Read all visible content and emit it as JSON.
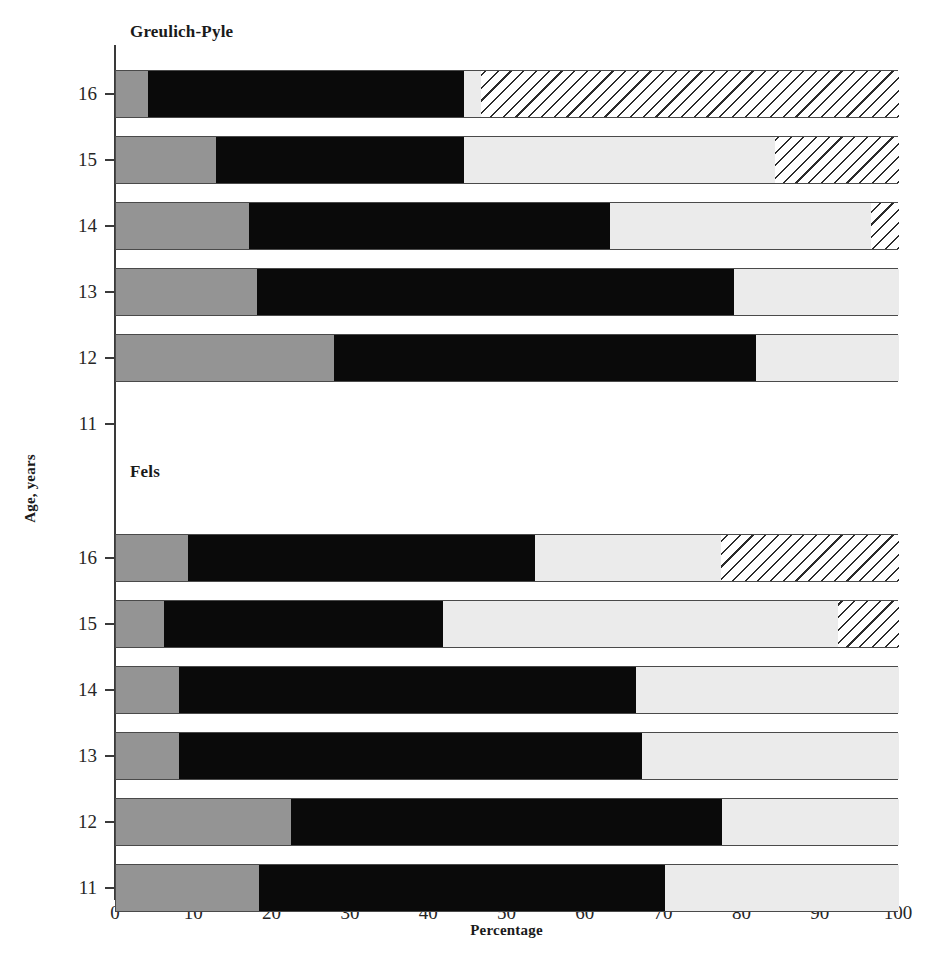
{
  "chart_data": {
    "type": "bar",
    "orientation": "horizontal",
    "stacked": true,
    "title": "",
    "xlabel": "Percentage",
    "ylabel": "Age, years",
    "xlim": [
      0,
      100
    ],
    "xticks": [
      0,
      10,
      20,
      30,
      40,
      50,
      60,
      70,
      80,
      90,
      100
    ],
    "grid": false,
    "legend": "none",
    "series": [
      {
        "name": "segment-1",
        "style": "solid-gray",
        "color": "#949494"
      },
      {
        "name": "segment-2",
        "style": "solid-black",
        "color": "#0a0a0a"
      },
      {
        "name": "segment-3",
        "style": "light-gray",
        "color": "#ebebeb"
      },
      {
        "name": "segment-4",
        "style": "hatched",
        "color": "#ffffff"
      }
    ],
    "panels": [
      {
        "name": "Greulich-Pyle",
        "categories": [
          "16",
          "15",
          "14",
          "13",
          "12",
          "11"
        ],
        "rows": [
          {
            "category": "16",
            "values": [
              4.1,
              40.3,
              2.2,
              53.4
            ]
          },
          {
            "category": "15",
            "values": [
              12.8,
              31.6,
              39.8,
              15.8
            ]
          },
          {
            "category": "14",
            "values": [
              17.0,
              46.1,
              33.3,
              3.6
            ]
          },
          {
            "category": "13",
            "values": [
              18.0,
              60.9,
              21.1,
              0.0
            ]
          },
          {
            "category": "12",
            "values": [
              27.8,
              53.9,
              18.3,
              0.0
            ]
          },
          {
            "category": "11",
            "values": [
              0.0,
              0.0,
              0.0,
              0.0
            ]
          }
        ]
      },
      {
        "name": "Fels",
        "categories": [
          "16",
          "15",
          "14",
          "13",
          "12",
          "11"
        ],
        "rows": [
          {
            "category": "16",
            "values": [
              9.2,
              44.3,
              23.8,
              22.7
            ]
          },
          {
            "category": "15",
            "values": [
              6.1,
              35.7,
              50.4,
              7.8
            ]
          },
          {
            "category": "14",
            "values": [
              8.0,
              58.4,
              33.6,
              0.0
            ]
          },
          {
            "category": "13",
            "values": [
              8.0,
              59.2,
              32.8,
              0.0
            ]
          },
          {
            "category": "12",
            "values": [
              22.3,
              55.1,
              22.6,
              0.0
            ]
          },
          {
            "category": "11",
            "values": [
              18.3,
              51.8,
              29.9,
              0.0
            ]
          }
        ]
      }
    ]
  },
  "axes": {
    "x_title": "Percentage",
    "y_title": "Age, years",
    "x_tick_labels": [
      "0",
      "10",
      "20",
      "30",
      "40",
      "50",
      "60",
      "70",
      "80",
      "90",
      "100"
    ],
    "y_tick_labels_top": [
      "16",
      "15",
      "14",
      "13",
      "12",
      "11"
    ],
    "y_tick_labels_bottom": [
      "16",
      "15",
      "14",
      "13",
      "12",
      "11"
    ]
  },
  "panels": {
    "top_heading": "Greulich-Pyle",
    "bottom_heading": "Fels"
  },
  "colors": {
    "solid_gray": "#949494",
    "solid_black": "#0a0a0a",
    "light_gray": "#ebebeb",
    "hatch_line": "#2b2b2b",
    "axis": "#3a3a3a",
    "background": "#ffffff"
  }
}
